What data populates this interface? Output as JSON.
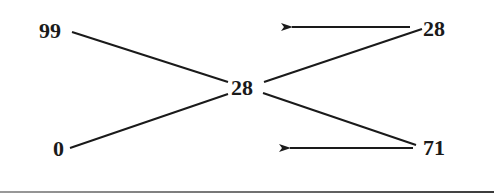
{
  "diagram": {
    "type": "compare-exchange",
    "inputs": [
      {
        "id": "in-top",
        "label": "99"
      },
      {
        "id": "in-bottom",
        "label": "0"
      }
    ],
    "center": {
      "id": "center",
      "label": "28"
    },
    "outputs": [
      {
        "id": "out-top",
        "label": "28"
      },
      {
        "id": "out-bottom",
        "label": "71"
      }
    ],
    "edges": [
      {
        "from": "99",
        "to": "28 (center)"
      },
      {
        "from": "0",
        "to": "28 (center)"
      },
      {
        "from": "28 (center)",
        "to": "28 (right)"
      },
      {
        "from": "28 (center)",
        "to": "71"
      }
    ],
    "arrows": [
      {
        "direction": "left",
        "near": "28 (right)"
      },
      {
        "direction": "left",
        "near": "71"
      }
    ],
    "colors": {
      "stroke": "#1a1a1a",
      "background": "#ffffff"
    }
  }
}
